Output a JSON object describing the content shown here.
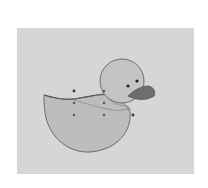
{
  "diagram": {
    "panel_color": "#d6d6d6",
    "body_fill": "#bdbdbd",
    "head_fill": "#c4c4c4",
    "outline_color": "#6b6b6b",
    "beak_fill": "#6e6e6e",
    "eye_color": "#222222",
    "control_point_color": "#333333",
    "control_points": [
      {
        "x": 74,
        "y": 91
      },
      {
        "x": 104,
        "y": 91
      },
      {
        "x": 74,
        "y": 103
      },
      {
        "x": 104,
        "y": 103
      },
      {
        "x": 74,
        "y": 115
      },
      {
        "x": 104,
        "y": 115
      },
      {
        "x": 133,
        "y": 115
      }
    ],
    "eyes": [
      {
        "x": 128,
        "y": 86
      },
      {
        "x": 137,
        "y": 81
      }
    ]
  }
}
